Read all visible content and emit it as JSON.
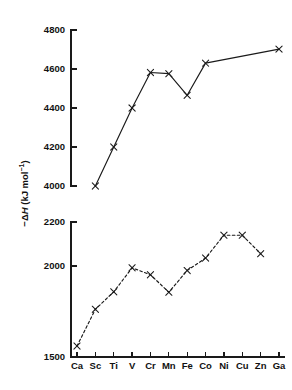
{
  "chart_data": {
    "type": "line",
    "title": "",
    "xlabel": "",
    "ylabel": "−ΔH (kJ mol⁻¹)",
    "ylabel_parts": {
      "prefix": "−",
      "delta": "Δ",
      "symbol": "H",
      "units": " (kJ mol",
      "exponent": "−1",
      "close": ")"
    },
    "categories": [
      "Ca",
      "Sc",
      "Ti",
      "V",
      "Cr",
      "Mn",
      "Fe",
      "Co",
      "Ni",
      "Cu",
      "Zn",
      "Ga"
    ],
    "grid": false,
    "legend": "none",
    "broken_axis": true,
    "panels": [
      {
        "name": "upper-panel",
        "ylim": [
          4000,
          4800
        ],
        "yticks": [
          4000,
          4200,
          4400,
          4600,
          4800
        ],
        "ytick_labels": [
          "4000",
          "4200",
          "4400",
          "4600",
          "4800"
        ],
        "series": [
          {
            "name": "M3+ hydration enthalpy",
            "style": "solid",
            "marker": "x",
            "points": [
              {
                "x": "Sc",
                "y": 4000
              },
              {
                "x": "Ti",
                "y": 4200
              },
              {
                "x": "V",
                "y": 4400
              },
              {
                "x": "Cr",
                "y": 4582
              },
              {
                "x": "Mn",
                "y": 4576
              },
              {
                "x": "Fe",
                "y": 4465
              },
              {
                "x": "Co",
                "y": 4630
              },
              {
                "x": "Ga",
                "y": 4702
              }
            ]
          }
        ]
      },
      {
        "name": "lower-panel",
        "ylim": [
          1500,
          2200
        ],
        "yticks": [
          1500,
          2000,
          2200
        ],
        "ytick_labels": [
          "1500",
          "2000",
          "2200"
        ],
        "nonlinear_spacing": true,
        "series": [
          {
            "name": "M2+ hydration enthalpy",
            "style": "dashed",
            "marker": "x",
            "points": [
              {
                "x": "Ca",
                "y": 1560
              },
              {
                "x": "Sc",
                "y": 1762
              },
              {
                "x": "Ti",
                "y": 1858
              },
              {
                "x": "V",
                "y": 1990
              },
              {
                "x": "Cr",
                "y": 1952
              },
              {
                "x": "Mn",
                "y": 1856
              },
              {
                "x": "Fe",
                "y": 1975
              },
              {
                "x": "Co",
                "y": 2036
              },
              {
                "x": "Ni",
                "y": 2140
              },
              {
                "x": "Cu",
                "y": 2140
              },
              {
                "x": "Zn",
                "y": 2056
              }
            ]
          }
        ]
      }
    ]
  }
}
